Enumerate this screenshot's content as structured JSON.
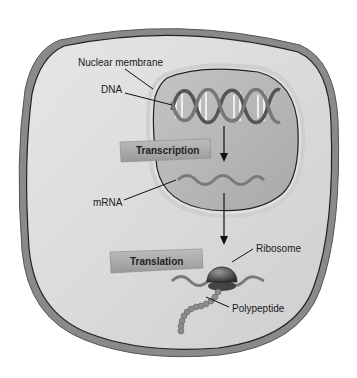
{
  "diagram": {
    "labels": {
      "nuclear_membrane": "Nuclear membrane",
      "dna": "DNA",
      "mrna": "mRNA",
      "ribosome": "Ribosome",
      "polypeptide": "Polypeptide"
    },
    "process_boxes": {
      "transcription": "Transcription",
      "translation": "Translation"
    },
    "colors": {
      "cell_outer_rim": "#8a8a8a",
      "cell_fill": "#d9d9d9",
      "nucleus_fill": "#b8b8b8",
      "box_fill": "#a9a9a9",
      "molecule": "#7a7a7a",
      "line": "#111111"
    }
  }
}
